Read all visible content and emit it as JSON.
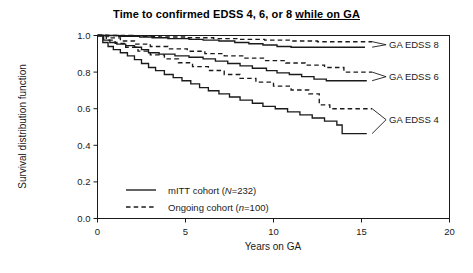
{
  "chart_data": {
    "type": "line",
    "title": "Time to confirmed EDSS 4, 6, or 8 while on GA",
    "title_plain": "Time to confirmed EDSS 4, 6, or 8 ",
    "title_underlined": "while on GA",
    "xlabel": "Years on GA",
    "ylabel": "Survival distribution function",
    "xlim": [
      0,
      20
    ],
    "ylim": [
      0.0,
      1.0
    ],
    "xticks": [
      0,
      5,
      10,
      15,
      20
    ],
    "xtick_labels": [
      "0",
      "5",
      "10",
      "15",
      "20"
    ],
    "yticks": [
      0.0,
      0.2,
      0.4,
      0.6,
      0.8,
      1.0
    ],
    "ytick_labels": [
      "0.0",
      "0.2",
      "0.4",
      "0.6",
      "0.8",
      "1.0"
    ],
    "grid": false,
    "legend_position": "lower-left-inside",
    "series": [
      {
        "name": "GA EDSS 8 — mITT cohort",
        "style": "solid",
        "group": "GA EDSS 8",
        "cohort": "mITT cohort (N=232)",
        "points": [
          [
            0.0,
            1.0
          ],
          [
            1.2,
            1.0
          ],
          [
            1.2,
            0.996
          ],
          [
            2.4,
            0.996
          ],
          [
            2.4,
            0.992
          ],
          [
            3.1,
            0.992
          ],
          [
            3.1,
            0.988
          ],
          [
            4.0,
            0.988
          ],
          [
            4.0,
            0.983
          ],
          [
            5.2,
            0.983
          ],
          [
            5.2,
            0.979
          ],
          [
            6.0,
            0.979
          ],
          [
            6.0,
            0.975
          ],
          [
            6.9,
            0.975
          ],
          [
            6.9,
            0.97
          ],
          [
            7.8,
            0.97
          ],
          [
            7.8,
            0.962
          ],
          [
            8.6,
            0.962
          ],
          [
            8.6,
            0.955
          ],
          [
            9.4,
            0.955
          ],
          [
            9.4,
            0.948
          ],
          [
            10.2,
            0.948
          ],
          [
            10.2,
            0.94
          ],
          [
            11.0,
            0.94
          ],
          [
            11.0,
            0.936
          ],
          [
            15.2,
            0.936
          ]
        ]
      },
      {
        "name": "GA EDSS 8 — Ongoing cohort",
        "style": "dashed",
        "group": "GA EDSS 8",
        "cohort": "Ongoing cohort (n=100)",
        "points": [
          [
            0.0,
            1.0
          ],
          [
            2.0,
            1.0
          ],
          [
            2.0,
            0.996
          ],
          [
            3.5,
            0.996
          ],
          [
            3.5,
            0.992
          ],
          [
            5.0,
            0.992
          ],
          [
            5.0,
            0.988
          ],
          [
            6.6,
            0.988
          ],
          [
            6.6,
            0.983
          ],
          [
            8.0,
            0.983
          ],
          [
            8.0,
            0.979
          ],
          [
            9.5,
            0.979
          ],
          [
            9.5,
            0.975
          ],
          [
            11.0,
            0.975
          ],
          [
            11.0,
            0.97
          ],
          [
            12.5,
            0.97
          ],
          [
            12.5,
            0.966
          ],
          [
            15.6,
            0.966
          ]
        ]
      },
      {
        "name": "GA EDSS 6 — mITT cohort",
        "style": "solid",
        "group": "GA EDSS 6",
        "cohort": "mITT cohort (N=232)",
        "points": [
          [
            0.0,
            1.0
          ],
          [
            0.35,
            1.0
          ],
          [
            0.35,
            0.975
          ],
          [
            0.7,
            0.975
          ],
          [
            0.7,
            0.962
          ],
          [
            1.1,
            0.962
          ],
          [
            1.1,
            0.953
          ],
          [
            1.6,
            0.953
          ],
          [
            1.6,
            0.945
          ],
          [
            2.1,
            0.945
          ],
          [
            2.1,
            0.936
          ],
          [
            2.5,
            0.936
          ],
          [
            2.5,
            0.923
          ],
          [
            2.9,
            0.923
          ],
          [
            2.9,
            0.906
          ],
          [
            3.5,
            0.906
          ],
          [
            3.5,
            0.898
          ],
          [
            4.4,
            0.898
          ],
          [
            4.4,
            0.889
          ],
          [
            5.2,
            0.889
          ],
          [
            5.2,
            0.881
          ],
          [
            6.0,
            0.881
          ],
          [
            6.0,
            0.872
          ],
          [
            6.7,
            0.872
          ],
          [
            6.7,
            0.86
          ],
          [
            7.4,
            0.86
          ],
          [
            7.4,
            0.847
          ],
          [
            8.1,
            0.847
          ],
          [
            8.1,
            0.834
          ],
          [
            8.8,
            0.834
          ],
          [
            8.8,
            0.821
          ],
          [
            9.6,
            0.821
          ],
          [
            9.6,
            0.808
          ],
          [
            10.2,
            0.808
          ],
          [
            10.2,
            0.796
          ],
          [
            10.9,
            0.796
          ],
          [
            10.9,
            0.787
          ],
          [
            11.6,
            0.787
          ],
          [
            11.6,
            0.775
          ],
          [
            12.3,
            0.775
          ],
          [
            12.3,
            0.762
          ],
          [
            13.0,
            0.762
          ],
          [
            13.0,
            0.753
          ],
          [
            15.3,
            0.753
          ]
        ]
      },
      {
        "name": "GA EDSS 6 — Ongoing cohort",
        "style": "dashed",
        "group": "GA EDSS 6",
        "cohort": "Ongoing cohort (n=100)",
        "points": [
          [
            0.0,
            1.0
          ],
          [
            0.6,
            1.0
          ],
          [
            0.6,
            0.987
          ],
          [
            1.3,
            0.987
          ],
          [
            1.3,
            0.97
          ],
          [
            2.1,
            0.97
          ],
          [
            2.1,
            0.953
          ],
          [
            3.0,
            0.953
          ],
          [
            3.0,
            0.94
          ],
          [
            4.0,
            0.94
          ],
          [
            4.0,
            0.927
          ],
          [
            5.1,
            0.927
          ],
          [
            5.1,
            0.914
          ],
          [
            6.1,
            0.914
          ],
          [
            6.1,
            0.901
          ],
          [
            7.2,
            0.901
          ],
          [
            7.2,
            0.889
          ],
          [
            8.3,
            0.889
          ],
          [
            8.3,
            0.876
          ],
          [
            9.5,
            0.876
          ],
          [
            9.5,
            0.863
          ],
          [
            10.7,
            0.863
          ],
          [
            10.7,
            0.85
          ],
          [
            11.8,
            0.85
          ],
          [
            11.8,
            0.838
          ],
          [
            12.9,
            0.838
          ],
          [
            12.9,
            0.825
          ],
          [
            14.0,
            0.825
          ],
          [
            14.0,
            0.8
          ],
          [
            15.6,
            0.8
          ]
        ]
      },
      {
        "name": "GA EDSS 4 — mITT cohort",
        "style": "solid",
        "group": "GA EDSS 4",
        "cohort": "mITT cohort (N=232)",
        "points": [
          [
            0.0,
            1.0
          ],
          [
            0.3,
            1.0
          ],
          [
            0.3,
            0.962
          ],
          [
            0.6,
            0.962
          ],
          [
            0.6,
            0.94
          ],
          [
            0.9,
            0.94
          ],
          [
            0.9,
            0.923
          ],
          [
            1.3,
            0.923
          ],
          [
            1.3,
            0.906
          ],
          [
            1.7,
            0.906
          ],
          [
            1.7,
            0.889
          ],
          [
            2.1,
            0.889
          ],
          [
            2.1,
            0.868
          ],
          [
            2.5,
            0.868
          ],
          [
            2.5,
            0.847
          ],
          [
            2.9,
            0.847
          ],
          [
            2.9,
            0.825
          ],
          [
            3.3,
            0.825
          ],
          [
            3.3,
            0.808
          ],
          [
            3.8,
            0.808
          ],
          [
            3.8,
            0.787
          ],
          [
            4.3,
            0.787
          ],
          [
            4.3,
            0.77
          ],
          [
            4.8,
            0.77
          ],
          [
            4.8,
            0.753
          ],
          [
            5.3,
            0.753
          ],
          [
            5.3,
            0.736
          ],
          [
            5.8,
            0.736
          ],
          [
            5.8,
            0.715
          ],
          [
            6.3,
            0.715
          ],
          [
            6.3,
            0.698
          ],
          [
            6.9,
            0.698
          ],
          [
            6.9,
            0.681
          ],
          [
            7.5,
            0.681
          ],
          [
            7.5,
            0.664
          ],
          [
            8.1,
            0.664
          ],
          [
            8.1,
            0.647
          ],
          [
            8.8,
            0.647
          ],
          [
            8.8,
            0.63
          ],
          [
            9.4,
            0.63
          ],
          [
            9.4,
            0.613
          ],
          [
            10.1,
            0.613
          ],
          [
            10.1,
            0.6
          ],
          [
            10.8,
            0.6
          ],
          [
            10.8,
            0.583
          ],
          [
            11.5,
            0.583
          ],
          [
            11.5,
            0.566
          ],
          [
            12.2,
            0.566
          ],
          [
            12.2,
            0.549
          ],
          [
            12.9,
            0.549
          ],
          [
            12.9,
            0.532
          ],
          [
            13.6,
            0.532
          ],
          [
            13.6,
            0.511
          ],
          [
            13.9,
            0.511
          ],
          [
            13.9,
            0.464
          ],
          [
            15.3,
            0.464
          ]
        ]
      },
      {
        "name": "GA EDSS 4 — Ongoing cohort",
        "style": "dashed",
        "group": "GA EDSS 4",
        "cohort": "Ongoing cohort (n=100)",
        "points": [
          [
            0.0,
            1.0
          ],
          [
            0.5,
            1.0
          ],
          [
            0.5,
            0.975
          ],
          [
            1.0,
            0.975
          ],
          [
            1.0,
            0.957
          ],
          [
            1.6,
            0.957
          ],
          [
            1.6,
            0.936
          ],
          [
            2.3,
            0.936
          ],
          [
            2.3,
            0.915
          ],
          [
            3.0,
            0.915
          ],
          [
            3.0,
            0.894
          ],
          [
            3.8,
            0.894
          ],
          [
            3.8,
            0.872
          ],
          [
            4.6,
            0.872
          ],
          [
            4.6,
            0.851
          ],
          [
            5.4,
            0.851
          ],
          [
            5.4,
            0.83
          ],
          [
            6.3,
            0.83
          ],
          [
            6.3,
            0.809
          ],
          [
            7.2,
            0.809
          ],
          [
            7.2,
            0.787
          ],
          [
            8.1,
            0.787
          ],
          [
            8.1,
            0.766
          ],
          [
            9.0,
            0.766
          ],
          [
            9.0,
            0.745
          ],
          [
            10.0,
            0.745
          ],
          [
            10.0,
            0.723
          ],
          [
            11.0,
            0.723
          ],
          [
            11.0,
            0.702
          ],
          [
            12.0,
            0.702
          ],
          [
            12.0,
            0.681
          ],
          [
            12.6,
            0.681
          ],
          [
            12.6,
            0.621
          ],
          [
            13.2,
            0.621
          ],
          [
            13.2,
            0.6
          ],
          [
            15.6,
            0.6
          ]
        ]
      }
    ],
    "annotations": [
      {
        "label": "GA EDSS 8",
        "y_upper": 0.966,
        "y_lower": 0.936,
        "label_y": 0.95,
        "x_anchor": 15.6
      },
      {
        "label": "GA EDSS 6",
        "y_upper": 0.8,
        "y_lower": 0.753,
        "label_y": 0.775,
        "x_anchor": 15.6
      },
      {
        "label": "GA EDSS 4",
        "y_upper": 0.6,
        "y_lower": 0.464,
        "label_y": 0.54,
        "x_anchor": 15.6
      }
    ],
    "legend": [
      {
        "label_prefix": "mITT cohort (",
        "label_italic": "N",
        "label_suffix": "=232)",
        "style": "solid"
      },
      {
        "label_prefix": "Ongoing cohort (",
        "label_italic": "n",
        "label_suffix": "=100)",
        "style": "dashed"
      }
    ]
  }
}
